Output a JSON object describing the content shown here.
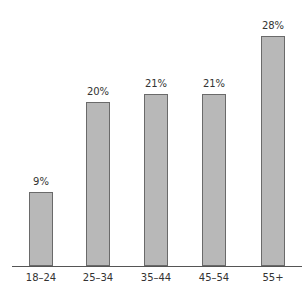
{
  "chart_data": {
    "type": "bar",
    "title": "",
    "xlabel": "",
    "ylabel": "",
    "categories": [
      "18–24",
      "25–34",
      "35–44",
      "45–54",
      "55+"
    ],
    "values": [
      9,
      20,
      21,
      21,
      28
    ],
    "value_labels": [
      "9%",
      "20%",
      "21%",
      "21%",
      "28%"
    ],
    "unit": "%",
    "ylim": [
      0,
      28
    ],
    "grid": false,
    "legend": null,
    "bar_color": "#b8b8b8",
    "bar_edge_color": "#6a6a6a"
  }
}
